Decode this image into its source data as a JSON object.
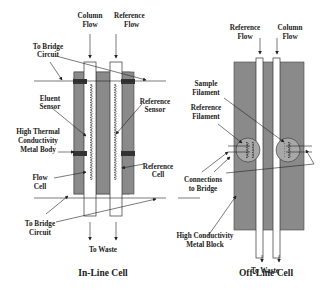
{
  "in_line_cell": {
    "title": "In-Line Cell",
    "labels": {
      "column_flow_1": "Column",
      "column_flow_2": "Flow",
      "reference_flow_1": "Reference",
      "reference_flow_2": "Flow",
      "to_bridge_top_1": "To Bridge",
      "to_bridge_top_2": "Circuit",
      "eluent_sensor_1": "Eluent",
      "eluent_sensor_2": "Sensor",
      "reference_sensor_1": "Reference",
      "reference_sensor_2": "Sensor",
      "metal_body_1": "High Thermal",
      "metal_body_2": "Conductivity",
      "metal_body_3": "Metal Body",
      "flow_cell_1": "Flow",
      "flow_cell_2": "Cell",
      "reference_cell_1": "Reference",
      "reference_cell_2": "Cell",
      "to_bridge_bottom_1": "To Bridge",
      "to_bridge_bottom_2": "Circuit",
      "to_waste": "To Waste"
    }
  },
  "off_line_cell": {
    "title": "Off-Line Cell",
    "labels": {
      "reference_flow_1": "Reference",
      "reference_flow_2": "Flow",
      "column_flow_1": "Column",
      "column_flow_2": "Flow",
      "sample_filament_1": "Sample",
      "sample_filament_2": "Filament",
      "reference_filament_1": "Reference",
      "reference_filament_2": "Filament",
      "connections_1": "Connections",
      "connections_2": "to Bridge",
      "metal_block_1": "High Conductivity",
      "metal_block_2": "Metal Block",
      "to_waste": "To Waste"
    }
  },
  "colors": {
    "metal": "#8a8a8a",
    "tube": "#ffffff",
    "line": "#222222"
  }
}
